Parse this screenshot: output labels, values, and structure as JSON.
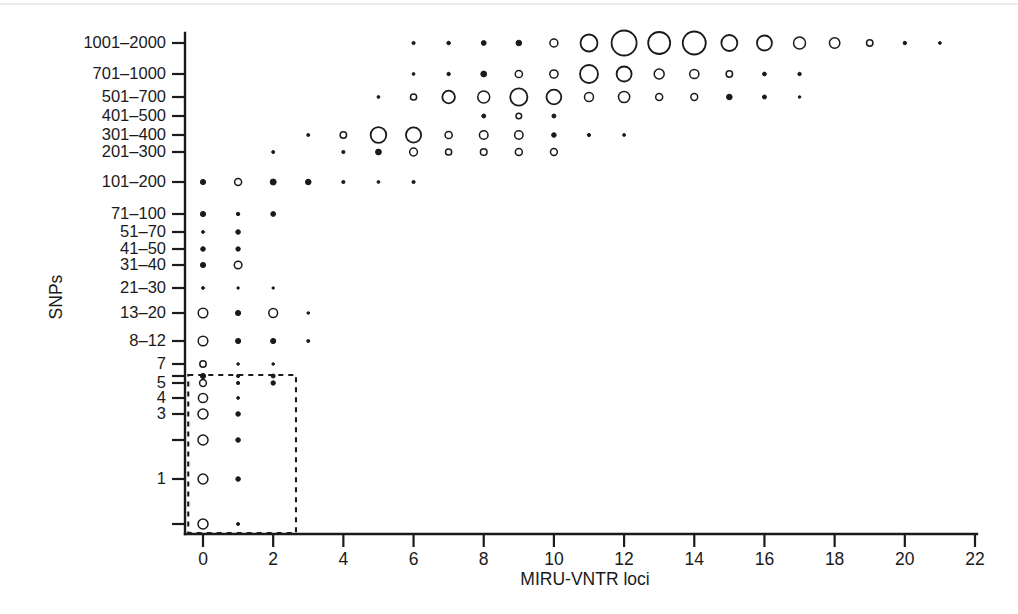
{
  "figure": {
    "background": "#ffffff",
    "ink_color": "#1a1a1a",
    "y_axis_title": "SNPs",
    "x_axis_title": "MIRU-VNTR loci"
  },
  "chart_data": {
    "type": "scatter",
    "title": "",
    "xlabel": "MIRU-VNTR loci",
    "ylabel": "SNPs",
    "grid": false,
    "legend": null,
    "marker_encoding": "circle area proportional to pair count; small counts drawn as filled dots, large counts as open circles",
    "xlim": [
      -0.55,
      22.4
    ],
    "x_ticks": [
      0,
      2,
      4,
      6,
      8,
      10,
      12,
      14,
      16,
      18,
      20,
      22
    ],
    "x_tick_labels": [
      "0",
      "2",
      "4",
      "6",
      "8",
      "10",
      "12",
      "14",
      "16",
      "18",
      "20",
      "22"
    ],
    "y_categories": [
      "1001–2000",
      "701–1000",
      "501–700",
      "401–500",
      "301–400",
      "201–300",
      "101–200",
      "71–100",
      "51–70",
      "41–50",
      "31–40",
      "21–30",
      "13–20",
      "8–12",
      "7",
      "6",
      "5",
      "4",
      "3",
      "2",
      "1",
      "0"
    ],
    "y_tick_labels_visible": [
      "1001–2000",
      "701–1000",
      "501–700",
      "401–500",
      "301–400",
      "201–300",
      "101–200",
      "71–100",
      "51–70",
      "41–50",
      "31–40",
      "21–30",
      "13–20",
      "8–12",
      "7",
      "",
      "5",
      "4",
      "3",
      "",
      "1",
      "",
      "0"
    ],
    "y_pixel_positions": [
      43,
      74,
      97,
      116,
      135,
      152,
      182,
      214,
      232,
      249,
      265,
      288,
      313,
      341,
      364,
      376,
      383,
      398,
      414,
      440,
      479,
      524
    ],
    "highlight_box": {
      "label": "dashed selection box",
      "x_range": [
        -0.42,
        2.65
      ],
      "y_category_range": [
        "6",
        "0"
      ],
      "style": "dashed"
    },
    "points": [
      {
        "row": "1001–2000",
        "x": 6,
        "r": 1.6,
        "filled": true
      },
      {
        "row": "1001–2000",
        "x": 7,
        "r": 1.8,
        "filled": true
      },
      {
        "row": "1001–2000",
        "x": 8,
        "r": 2.4,
        "filled": true
      },
      {
        "row": "1001–2000",
        "x": 9,
        "r": 2.8,
        "filled": true
      },
      {
        "row": "1001–2000",
        "x": 10,
        "r": 4.0,
        "filled": false
      },
      {
        "row": "1001–2000",
        "x": 11,
        "r": 8.5,
        "filled": false
      },
      {
        "row": "1001–2000",
        "x": 12,
        "r": 12.5,
        "filled": false
      },
      {
        "row": "1001–2000",
        "x": 13,
        "r": 11.0,
        "filled": false
      },
      {
        "row": "1001–2000",
        "x": 14,
        "r": 11.5,
        "filled": false
      },
      {
        "row": "1001–2000",
        "x": 15,
        "r": 8.0,
        "filled": false
      },
      {
        "row": "1001–2000",
        "x": 16,
        "r": 7.5,
        "filled": false
      },
      {
        "row": "1001–2000",
        "x": 17,
        "r": 6.0,
        "filled": false
      },
      {
        "row": "1001–2000",
        "x": 18,
        "r": 5.2,
        "filled": false
      },
      {
        "row": "1001–2000",
        "x": 19,
        "r": 3.2,
        "filled": false
      },
      {
        "row": "1001–2000",
        "x": 20,
        "r": 1.7,
        "filled": true
      },
      {
        "row": "1001–2000",
        "x": 21,
        "r": 1.4,
        "filled": true
      },
      {
        "row": "701–1000",
        "x": 6,
        "r": 1.4,
        "filled": true
      },
      {
        "row": "701–1000",
        "x": 7,
        "r": 1.7,
        "filled": true
      },
      {
        "row": "701–1000",
        "x": 8,
        "r": 2.9,
        "filled": true
      },
      {
        "row": "701–1000",
        "x": 9,
        "r": 3.6,
        "filled": false
      },
      {
        "row": "701–1000",
        "x": 10,
        "r": 4.1,
        "filled": false
      },
      {
        "row": "701–1000",
        "x": 11,
        "r": 9.0,
        "filled": false
      },
      {
        "row": "701–1000",
        "x": 12,
        "r": 7.5,
        "filled": false
      },
      {
        "row": "701–1000",
        "x": 13,
        "r": 5.0,
        "filled": false
      },
      {
        "row": "701–1000",
        "x": 14,
        "r": 4.6,
        "filled": false
      },
      {
        "row": "701–1000",
        "x": 15,
        "r": 3.2,
        "filled": false
      },
      {
        "row": "701–1000",
        "x": 16,
        "r": 1.9,
        "filled": true
      },
      {
        "row": "701–1000",
        "x": 17,
        "r": 1.7,
        "filled": true
      },
      {
        "row": "501–700",
        "x": 5,
        "r": 1.4,
        "filled": true
      },
      {
        "row": "501–700",
        "x": 6,
        "r": 3.1,
        "filled": false
      },
      {
        "row": "501–700",
        "x": 7,
        "r": 6.3,
        "filled": false
      },
      {
        "row": "501–700",
        "x": 8,
        "r": 6.0,
        "filled": false
      },
      {
        "row": "501–700",
        "x": 9,
        "r": 8.6,
        "filled": false
      },
      {
        "row": "501–700",
        "x": 10,
        "r": 7.4,
        "filled": false
      },
      {
        "row": "501–700",
        "x": 11,
        "r": 4.5,
        "filled": false
      },
      {
        "row": "501–700",
        "x": 12,
        "r": 5.6,
        "filled": false
      },
      {
        "row": "501–700",
        "x": 13,
        "r": 3.5,
        "filled": false
      },
      {
        "row": "501–700",
        "x": 14,
        "r": 3.4,
        "filled": false
      },
      {
        "row": "501–700",
        "x": 15,
        "r": 2.8,
        "filled": true
      },
      {
        "row": "501–700",
        "x": 16,
        "r": 2.0,
        "filled": true
      },
      {
        "row": "501–700",
        "x": 17,
        "r": 1.3,
        "filled": true
      },
      {
        "row": "401–500",
        "x": 8,
        "r": 2.0,
        "filled": true
      },
      {
        "row": "401–500",
        "x": 9,
        "r": 2.8,
        "filled": false
      },
      {
        "row": "401–500",
        "x": 10,
        "r": 2.0,
        "filled": true
      },
      {
        "row": "301–400",
        "x": 3,
        "r": 1.5,
        "filled": true
      },
      {
        "row": "301–400",
        "x": 4,
        "r": 3.2,
        "filled": false
      },
      {
        "row": "301–400",
        "x": 5,
        "r": 7.8,
        "filled": false
      },
      {
        "row": "301–400",
        "x": 6,
        "r": 7.6,
        "filled": false
      },
      {
        "row": "301–400",
        "x": 7,
        "r": 3.6,
        "filled": false
      },
      {
        "row": "301–400",
        "x": 8,
        "r": 4.3,
        "filled": false
      },
      {
        "row": "301–400",
        "x": 9,
        "r": 4.2,
        "filled": false
      },
      {
        "row": "301–400",
        "x": 10,
        "r": 2.3,
        "filled": true
      },
      {
        "row": "301–400",
        "x": 11,
        "r": 1.6,
        "filled": true
      },
      {
        "row": "301–400",
        "x": 12,
        "r": 1.4,
        "filled": true
      },
      {
        "row": "201–300",
        "x": 2,
        "r": 1.5,
        "filled": true
      },
      {
        "row": "201–300",
        "x": 4,
        "r": 1.6,
        "filled": true
      },
      {
        "row": "201–300",
        "x": 5,
        "r": 2.9,
        "filled": true
      },
      {
        "row": "201–300",
        "x": 6,
        "r": 3.9,
        "filled": false
      },
      {
        "row": "201–300",
        "x": 7,
        "r": 3.1,
        "filled": false
      },
      {
        "row": "201–300",
        "x": 8,
        "r": 3.3,
        "filled": false
      },
      {
        "row": "201–300",
        "x": 9,
        "r": 3.5,
        "filled": false
      },
      {
        "row": "201–300",
        "x": 10,
        "r": 3.4,
        "filled": false
      },
      {
        "row": "101–200",
        "x": 0,
        "r": 2.6,
        "filled": true
      },
      {
        "row": "101–200",
        "x": 1,
        "r": 3.5,
        "filled": false
      },
      {
        "row": "101–200",
        "x": 2,
        "r": 3.0,
        "filled": true
      },
      {
        "row": "101–200",
        "x": 3,
        "r": 2.8,
        "filled": true
      },
      {
        "row": "101–200",
        "x": 4,
        "r": 1.6,
        "filled": true
      },
      {
        "row": "101–200",
        "x": 5,
        "r": 1.4,
        "filled": true
      },
      {
        "row": "101–200",
        "x": 6,
        "r": 1.6,
        "filled": true
      },
      {
        "row": "71–100",
        "x": 0,
        "r": 2.6,
        "filled": true
      },
      {
        "row": "71–100",
        "x": 1,
        "r": 1.7,
        "filled": true
      },
      {
        "row": "71–100",
        "x": 2,
        "r": 2.4,
        "filled": true
      },
      {
        "row": "51–70",
        "x": 0,
        "r": 1.4,
        "filled": true
      },
      {
        "row": "51–70",
        "x": 1,
        "r": 2.3,
        "filled": true
      },
      {
        "row": "41–50",
        "x": 0,
        "r": 2.3,
        "filled": true
      },
      {
        "row": "41–50",
        "x": 1,
        "r": 2.2,
        "filled": true
      },
      {
        "row": "31–40",
        "x": 0,
        "r": 2.6,
        "filled": true
      },
      {
        "row": "31–40",
        "x": 1,
        "r": 3.8,
        "filled": false
      },
      {
        "row": "21–30",
        "x": 0,
        "r": 1.4,
        "filled": true
      },
      {
        "row": "21–30",
        "x": 1,
        "r": 1.2,
        "filled": true
      },
      {
        "row": "21–30",
        "x": 2,
        "r": 1.2,
        "filled": true
      },
      {
        "row": "13–20",
        "x": 0,
        "r": 4.8,
        "filled": false
      },
      {
        "row": "13–20",
        "x": 1,
        "r": 2.6,
        "filled": true
      },
      {
        "row": "13–20",
        "x": 2,
        "r": 4.4,
        "filled": false
      },
      {
        "row": "13–20",
        "x": 3,
        "r": 1.3,
        "filled": true
      },
      {
        "row": "8–12",
        "x": 0,
        "r": 4.8,
        "filled": false
      },
      {
        "row": "8–12",
        "x": 1,
        "r": 2.6,
        "filled": true
      },
      {
        "row": "8–12",
        "x": 2,
        "r": 2.6,
        "filled": true
      },
      {
        "row": "8–12",
        "x": 3,
        "r": 1.5,
        "filled": true
      },
      {
        "row": "7",
        "x": 0,
        "r": 3.2,
        "filled": false
      },
      {
        "row": "7",
        "x": 1,
        "r": 1.3,
        "filled": true
      },
      {
        "row": "7",
        "x": 2,
        "r": 1.3,
        "filled": true
      },
      {
        "row": "6",
        "x": 0,
        "r": 2.6,
        "filled": true
      },
      {
        "row": "6",
        "x": 1,
        "r": 1.6,
        "filled": true
      },
      {
        "row": "6",
        "x": 2,
        "r": 2.0,
        "filled": true
      },
      {
        "row": "5",
        "x": 0,
        "r": 3.4,
        "filled": false
      },
      {
        "row": "5",
        "x": 1,
        "r": 1.6,
        "filled": true
      },
      {
        "row": "5",
        "x": 2,
        "r": 2.2,
        "filled": true
      },
      {
        "row": "4",
        "x": 0,
        "r": 4.6,
        "filled": false
      },
      {
        "row": "4",
        "x": 1,
        "r": 1.4,
        "filled": true
      },
      {
        "row": "3",
        "x": 0,
        "r": 5.0,
        "filled": false
      },
      {
        "row": "3",
        "x": 1,
        "r": 2.3,
        "filled": true
      },
      {
        "row": "2",
        "x": 0,
        "r": 5.0,
        "filled": false
      },
      {
        "row": "2",
        "x": 1,
        "r": 2.3,
        "filled": true
      },
      {
        "row": "1",
        "x": 0,
        "r": 4.9,
        "filled": false
      },
      {
        "row": "1",
        "x": 1,
        "r": 2.3,
        "filled": true
      },
      {
        "row": "0",
        "x": 0,
        "r": 5.0,
        "filled": false
      },
      {
        "row": "0",
        "x": 1,
        "r": 1.5,
        "filled": true
      }
    ]
  }
}
